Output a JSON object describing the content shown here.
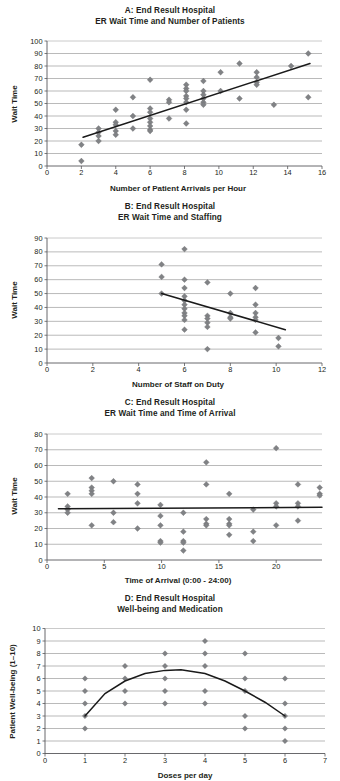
{
  "figure": {
    "panel_count": 4,
    "marker_color": "#808285",
    "gridline_color": "#9c9c9c",
    "trendline_color": "#1a1a1a",
    "text_color": "#231f20"
  },
  "panels": {
    "a": {
      "id": "A",
      "title_line1": "A: End Result Hospital",
      "title_line2": "ER Wait Time and Number of Patients",
      "xlabel": "Number of Patient Arrivals per Hour",
      "ylabel": "Wait Time",
      "xticks": [
        "0",
        "2",
        "4",
        "6",
        "8",
        "10",
        "12",
        "14",
        "16"
      ],
      "yticks": [
        "0",
        "10",
        "20",
        "30",
        "40",
        "50",
        "60",
        "70",
        "80",
        "90",
        "100"
      ]
    },
    "b": {
      "id": "B",
      "title_line1": "B: End Result Hospital",
      "title_line2": "ER Wait Time and Staffing",
      "xlabel": "Number of Staff on Duty",
      "ylabel": "Wait Time",
      "xticks": [
        "0",
        "2",
        "4",
        "6",
        "8",
        "10",
        "12"
      ],
      "yticks": [
        "0",
        "10",
        "20",
        "30",
        "40",
        "50",
        "60",
        "70",
        "80",
        "90"
      ]
    },
    "c": {
      "id": "C",
      "title_line1": "C: End Result Hospital",
      "title_line2": "ER Wait Time and Time of Arrival",
      "xlabel": "Time of Arrival (0:00 - 24:00)",
      "ylabel": "Wait Time",
      "xticks": [
        "0",
        "5",
        "10",
        "15",
        "20"
      ],
      "yticks": [
        "0",
        "10",
        "20",
        "30",
        "40",
        "50",
        "60",
        "70",
        "80"
      ]
    },
    "d": {
      "id": "D",
      "title_line1": "D: End Result Hospital",
      "title_line2": "Well-being and Medication",
      "xlabel": "Doses per day",
      "ylabel": "Patient Well-being (1–10)",
      "xticks": [
        "0",
        "1",
        "2",
        "3",
        "4",
        "5",
        "6",
        "7"
      ],
      "yticks": [
        "0",
        "1",
        "2",
        "3",
        "4",
        "5",
        "6",
        "7",
        "8",
        "9",
        "10"
      ]
    }
  },
  "chart_data": [
    {
      "type": "scatter",
      "panel": "A",
      "title": "A: End Result Hospital / ER Wait Time and Number of Patients",
      "xlabel": "Number of Patient Arrivals per Hour",
      "ylabel": "Wait Time",
      "xlim": [
        0,
        16
      ],
      "ylim": [
        0,
        100
      ],
      "xticks": [
        0,
        2,
        4,
        6,
        8,
        10,
        12,
        14,
        16
      ],
      "yticks": [
        0,
        10,
        20,
        30,
        40,
        50,
        60,
        70,
        80,
        90,
        100
      ],
      "grid": "horizontal",
      "legend": "none",
      "points": [
        [
          2.0,
          17
        ],
        [
          2.0,
          4
        ],
        [
          3.0,
          30
        ],
        [
          3.0,
          27
        ],
        [
          3.0,
          24
        ],
        [
          3.0,
          20
        ],
        [
          4.0,
          45
        ],
        [
          4.0,
          35
        ],
        [
          4.0,
          33
        ],
        [
          4.0,
          28
        ],
        [
          4.0,
          25
        ],
        [
          5.0,
          55
        ],
        [
          5.0,
          40
        ],
        [
          5.0,
          30
        ],
        [
          6.0,
          69
        ],
        [
          6.0,
          46
        ],
        [
          6.0,
          43
        ],
        [
          6.0,
          38
        ],
        [
          6.0,
          35
        ],
        [
          6.0,
          32
        ],
        [
          6.0,
          29
        ],
        [
          6.0,
          28
        ],
        [
          7.1,
          53
        ],
        [
          7.1,
          51
        ],
        [
          7.1,
          38
        ],
        [
          8.1,
          65
        ],
        [
          8.1,
          62
        ],
        [
          8.1,
          60
        ],
        [
          8.1,
          56
        ],
        [
          8.1,
          54
        ],
        [
          8.1,
          51
        ],
        [
          8.1,
          45
        ],
        [
          8.1,
          34
        ],
        [
          9.1,
          68
        ],
        [
          9.1,
          60
        ],
        [
          9.1,
          57
        ],
        [
          9.1,
          54
        ],
        [
          9.1,
          51
        ],
        [
          9.1,
          49
        ],
        [
          10.1,
          75
        ],
        [
          10.1,
          60
        ],
        [
          11.2,
          82
        ],
        [
          11.2,
          54
        ],
        [
          12.2,
          75
        ],
        [
          12.2,
          71
        ],
        [
          12.2,
          67
        ],
        [
          12.2,
          65
        ],
        [
          13.2,
          49
        ],
        [
          14.2,
          80
        ],
        [
          15.2,
          90
        ],
        [
          15.2,
          55
        ]
      ],
      "trendline": {
        "x1": 2.1,
        "y1": 23,
        "x2": 15.3,
        "y2": 82
      },
      "trend_direction": "positive"
    },
    {
      "type": "scatter",
      "panel": "B",
      "title": "B: End Result Hospital / ER Wait Time and Staffing",
      "xlabel": "Number of Staff on Duty",
      "ylabel": "Wait Time",
      "xlim": [
        0,
        12
      ],
      "ylim": [
        0,
        90
      ],
      "xticks": [
        0,
        2,
        4,
        6,
        8,
        10,
        12
      ],
      "yticks": [
        0,
        10,
        20,
        30,
        40,
        50,
        60,
        70,
        80,
        90
      ],
      "grid": "horizontal",
      "legend": "none",
      "points": [
        [
          5.0,
          71
        ],
        [
          5.0,
          62
        ],
        [
          5.0,
          50
        ],
        [
          6.0,
          82
        ],
        [
          6.0,
          60
        ],
        [
          6.0,
          54
        ],
        [
          6.0,
          48
        ],
        [
          6.0,
          45
        ],
        [
          6.0,
          42
        ],
        [
          6.0,
          39
        ],
        [
          6.0,
          36
        ],
        [
          6.0,
          34
        ],
        [
          6.0,
          31
        ],
        [
          6.0,
          24
        ],
        [
          7.0,
          58
        ],
        [
          7.0,
          34
        ],
        [
          7.0,
          32
        ],
        [
          7.0,
          29
        ],
        [
          7.0,
          26
        ],
        [
          7.0,
          10
        ],
        [
          8.0,
          50
        ],
        [
          8.0,
          36
        ],
        [
          8.0,
          33
        ],
        [
          8.0,
          32
        ],
        [
          9.1,
          54
        ],
        [
          9.1,
          42
        ],
        [
          9.1,
          36
        ],
        [
          9.1,
          33
        ],
        [
          9.1,
          31
        ],
        [
          9.1,
          22
        ],
        [
          10.1,
          18
        ],
        [
          10.1,
          12
        ]
      ],
      "trendline": {
        "x1": 5.0,
        "y1": 50,
        "x2": 10.4,
        "y2": 24
      },
      "trend_direction": "negative"
    },
    {
      "type": "scatter",
      "panel": "C",
      "title": "C: End Result Hospital / ER Wait Time and Time of Arrival",
      "xlabel": "Time of Arrival (0:00 - 24:00)",
      "ylabel": "Wait Time",
      "xlim": [
        0,
        24
      ],
      "ylim": [
        0,
        80
      ],
      "xticks": [
        0,
        5,
        10,
        15,
        20
      ],
      "yticks": [
        0,
        10,
        20,
        30,
        40,
        50,
        60,
        70,
        80
      ],
      "grid": "horizontal",
      "legend": "none",
      "points": [
        [
          1.8,
          42
        ],
        [
          1.8,
          34
        ],
        [
          1.8,
          32
        ],
        [
          1.8,
          30
        ],
        [
          3.9,
          52
        ],
        [
          3.9,
          46
        ],
        [
          3.9,
          44
        ],
        [
          3.9,
          42
        ],
        [
          3.9,
          22
        ],
        [
          5.8,
          50
        ],
        [
          5.8,
          30
        ],
        [
          5.8,
          24
        ],
        [
          7.9,
          48
        ],
        [
          7.9,
          42
        ],
        [
          7.9,
          36
        ],
        [
          7.9,
          20
        ],
        [
          9.9,
          35
        ],
        [
          9.9,
          28
        ],
        [
          9.9,
          22
        ],
        [
          9.9,
          12
        ],
        [
          9.9,
          11
        ],
        [
          11.9,
          30
        ],
        [
          11.9,
          18
        ],
        [
          11.9,
          12
        ],
        [
          11.9,
          11
        ],
        [
          11.9,
          6
        ],
        [
          13.9,
          62
        ],
        [
          13.9,
          48
        ],
        [
          13.9,
          26
        ],
        [
          13.9,
          23
        ],
        [
          13.9,
          22
        ],
        [
          15.9,
          42
        ],
        [
          15.9,
          26
        ],
        [
          15.9,
          23
        ],
        [
          15.9,
          22
        ],
        [
          15.9,
          16
        ],
        [
          18.0,
          32
        ],
        [
          18.0,
          18
        ],
        [
          18.0,
          12
        ],
        [
          20.0,
          71
        ],
        [
          20.0,
          36
        ],
        [
          20.0,
          34
        ],
        [
          20.0,
          22
        ],
        [
          21.9,
          48
        ],
        [
          21.9,
          36
        ],
        [
          21.9,
          34
        ],
        [
          21.9,
          25
        ],
        [
          23.8,
          46
        ],
        [
          23.8,
          42
        ],
        [
          23.8,
          41
        ]
      ],
      "trendline": {
        "x1": 1.0,
        "y1": 32.5,
        "x2": 24.0,
        "y2": 33.5
      },
      "trend_direction": "flat"
    },
    {
      "type": "scatter",
      "panel": "D",
      "title": "D: End Result Hospital / Well-being and Medication",
      "xlabel": "Doses per day",
      "ylabel": "Patient Well-being (1–10)",
      "xlim": [
        0,
        7
      ],
      "ylim": [
        0,
        10
      ],
      "xticks": [
        0,
        1,
        2,
        3,
        4,
        5,
        6,
        7
      ],
      "yticks": [
        0,
        1,
        2,
        3,
        4,
        5,
        6,
        7,
        8,
        9,
        10
      ],
      "grid": "horizontal",
      "legend": "none",
      "points": [
        [
          1,
          6
        ],
        [
          1,
          5
        ],
        [
          1,
          4
        ],
        [
          1,
          3
        ],
        [
          1,
          2
        ],
        [
          2,
          7
        ],
        [
          2,
          6
        ],
        [
          2,
          5
        ],
        [
          2,
          4
        ],
        [
          3,
          8
        ],
        [
          3,
          7
        ],
        [
          3,
          6
        ],
        [
          3,
          5
        ],
        [
          3,
          4
        ],
        [
          4,
          9
        ],
        [
          4,
          8
        ],
        [
          4,
          7
        ],
        [
          4,
          5
        ],
        [
          4,
          4
        ],
        [
          5,
          8
        ],
        [
          5,
          6
        ],
        [
          5,
          5
        ],
        [
          5,
          3
        ],
        [
          5,
          2
        ],
        [
          6,
          6
        ],
        [
          6,
          4
        ],
        [
          6,
          3
        ],
        [
          6,
          2
        ],
        [
          6,
          1
        ]
      ],
      "trendline_type": "quadratic",
      "trendline_points": [
        [
          1.0,
          3.0
        ],
        [
          1.5,
          4.8
        ],
        [
          2.0,
          5.8
        ],
        [
          2.5,
          6.4
        ],
        [
          3.0,
          6.65
        ],
        [
          3.4,
          6.7
        ],
        [
          4.0,
          6.4
        ],
        [
          4.5,
          5.8
        ],
        [
          5.0,
          5.0
        ],
        [
          5.5,
          4.1
        ],
        [
          6.0,
          3.0
        ]
      ],
      "trend_direction": "curvilinear"
    }
  ]
}
